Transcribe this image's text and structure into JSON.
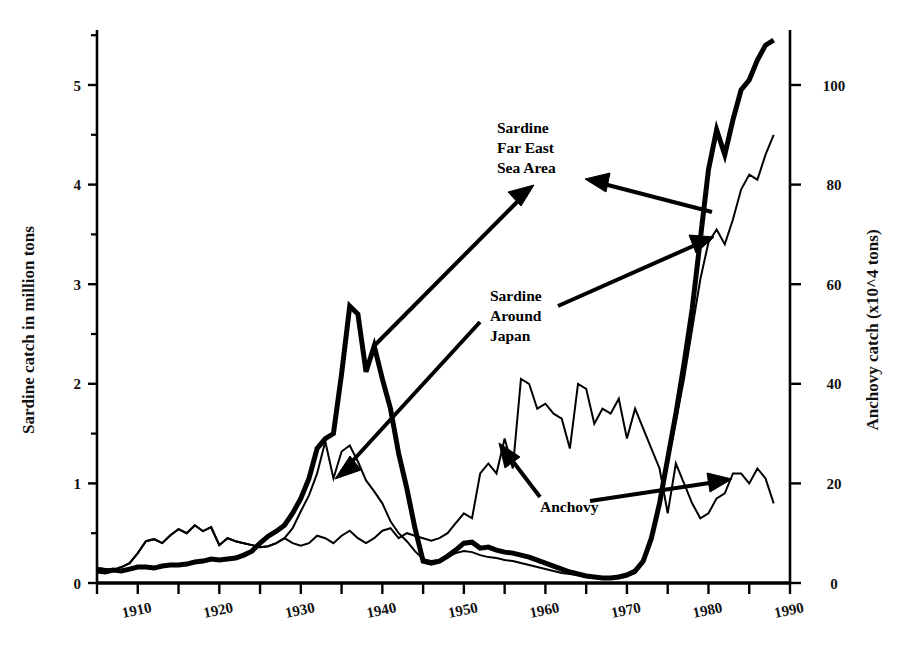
{
  "chart_data": {
    "type": "line",
    "title": "",
    "xlabel": "",
    "ylabel": "Sardine catch in million tons",
    "y2label": "Anchovy catch (x10^4 tons)",
    "xlim": [
      1905,
      1990
    ],
    "ylim": [
      0,
      5.5
    ],
    "y2lim": [
      0,
      110
    ],
    "grid": false,
    "legend_position": "inline-annotations",
    "xticks": [
      1910,
      1920,
      1930,
      1940,
      1950,
      1960,
      1970,
      1980,
      1990
    ],
    "xtick_labels": [
      "1910",
      "1920",
      "1930",
      "1940",
      "1950",
      "1960",
      "1970",
      "1980",
      "1990"
    ],
    "xminor_ticks": [
      1905,
      1915,
      1925,
      1935,
      1945,
      1955,
      1965,
      1975,
      1985
    ],
    "yticks": [
      0,
      1,
      2,
      3,
      4,
      5
    ],
    "ytick_labels": [
      "0",
      "1",
      "2",
      "3",
      "4",
      "5"
    ],
    "yminor_ticks": [
      0.5,
      1.5,
      2.5,
      3.5,
      4.5,
      5.5
    ],
    "y2ticks": [
      0,
      20,
      40,
      60,
      80,
      100
    ],
    "y2tick_labels": [
      "0",
      "20",
      "40",
      "60",
      "80",
      "100"
    ],
    "series": [
      {
        "name": "Sardine Far East Sea Area",
        "axis": "left",
        "style": "thick",
        "linewidth": 5,
        "color": "#000000",
        "x": [
          1905,
          1906,
          1907,
          1908,
          1909,
          1910,
          1911,
          1912,
          1913,
          1914,
          1915,
          1916,
          1917,
          1918,
          1919,
          1920,
          1921,
          1922,
          1923,
          1924,
          1925,
          1926,
          1927,
          1928,
          1929,
          1930,
          1931,
          1932,
          1933,
          1934,
          1935,
          1936,
          1937,
          1938,
          1939,
          1940,
          1941,
          1942,
          1943,
          1944,
          1945,
          1946,
          1947,
          1948,
          1949,
          1950,
          1951,
          1952,
          1953,
          1954,
          1955,
          1956,
          1957,
          1958,
          1959,
          1960,
          1961,
          1962,
          1963,
          1964,
          1965,
          1966,
          1967,
          1968,
          1969,
          1970,
          1971,
          1972,
          1973,
          1974,
          1975,
          1976,
          1977,
          1978,
          1979,
          1980,
          1981,
          1982,
          1983,
          1984,
          1985,
          1986,
          1987,
          1988
        ],
        "y": [
          0.12,
          0.11,
          0.13,
          0.12,
          0.14,
          0.16,
          0.16,
          0.15,
          0.17,
          0.18,
          0.18,
          0.19,
          0.21,
          0.22,
          0.24,
          0.23,
          0.24,
          0.25,
          0.28,
          0.32,
          0.4,
          0.47,
          0.52,
          0.58,
          0.7,
          0.85,
          1.05,
          1.35,
          1.45,
          1.5,
          2.1,
          2.78,
          2.7,
          2.12,
          2.38,
          2.05,
          1.75,
          1.3,
          0.95,
          0.55,
          0.22,
          0.2,
          0.22,
          0.27,
          0.33,
          0.4,
          0.41,
          0.35,
          0.36,
          0.33,
          0.31,
          0.3,
          0.28,
          0.26,
          0.23,
          0.2,
          0.17,
          0.14,
          0.11,
          0.09,
          0.07,
          0.06,
          0.05,
          0.05,
          0.06,
          0.08,
          0.12,
          0.22,
          0.45,
          0.8,
          1.25,
          1.7,
          2.2,
          2.75,
          3.45,
          4.15,
          4.55,
          4.3,
          4.65,
          4.95,
          5.05,
          5.25,
          5.4,
          5.45
        ]
      },
      {
        "name": "Sardine Around Japan",
        "axis": "left",
        "style": "thin",
        "linewidth": 2,
        "color": "#000000",
        "x": [
          1905,
          1906,
          1907,
          1908,
          1909,
          1910,
          1911,
          1912,
          1913,
          1914,
          1915,
          1916,
          1917,
          1918,
          1919,
          1920,
          1921,
          1922,
          1923,
          1924,
          1925,
          1926,
          1927,
          1928,
          1929,
          1930,
          1931,
          1932,
          1933,
          1934,
          1935,
          1936,
          1937,
          1938,
          1939,
          1940,
          1941,
          1942,
          1943,
          1944,
          1945,
          1946,
          1947,
          1948,
          1949,
          1950,
          1951,
          1952,
          1953,
          1954,
          1955,
          1956,
          1957,
          1958,
          1959,
          1960,
          1961,
          1962,
          1963,
          1964,
          1965,
          1966,
          1967,
          1968,
          1969,
          1970,
          1971,
          1972,
          1973,
          1974,
          1975,
          1976,
          1977,
          1978,
          1979,
          1980,
          1981,
          1982,
          1983,
          1984,
          1985,
          1986,
          1987,
          1988
        ],
        "y": [
          0.15,
          0.14,
          0.13,
          0.16,
          0.2,
          0.3,
          0.42,
          0.44,
          0.4,
          0.48,
          0.54,
          0.5,
          0.58,
          0.52,
          0.56,
          0.38,
          0.45,
          0.42,
          0.4,
          0.38,
          0.36,
          0.37,
          0.4,
          0.45,
          0.55,
          0.72,
          0.88,
          1.1,
          1.42,
          1.05,
          1.32,
          1.38,
          1.22,
          1.03,
          0.92,
          0.8,
          0.62,
          0.5,
          0.42,
          0.32,
          0.24,
          0.22,
          0.23,
          0.26,
          0.3,
          0.32,
          0.31,
          0.28,
          0.26,
          0.25,
          0.23,
          0.22,
          0.2,
          0.18,
          0.16,
          0.14,
          0.12,
          0.1,
          0.09,
          0.08,
          0.07,
          0.06,
          0.05,
          0.05,
          0.06,
          0.07,
          0.1,
          0.2,
          0.42,
          0.78,
          1.22,
          1.62,
          2.05,
          2.55,
          3.05,
          3.42,
          3.55,
          3.4,
          3.65,
          3.95,
          4.1,
          4.05,
          4.3,
          4.5
        ]
      },
      {
        "name": "Anchovy",
        "axis": "right",
        "style": "thin",
        "linewidth": 2,
        "color": "#000000",
        "x": [
          1905,
          1906,
          1907,
          1908,
          1909,
          1910,
          1911,
          1912,
          1913,
          1914,
          1915,
          1916,
          1917,
          1918,
          1919,
          1920,
          1921,
          1922,
          1923,
          1924,
          1925,
          1926,
          1927,
          1928,
          1929,
          1930,
          1931,
          1932,
          1933,
          1934,
          1935,
          1936,
          1937,
          1938,
          1939,
          1940,
          1941,
          1942,
          1943,
          1944,
          1945,
          1946,
          1947,
          1948,
          1949,
          1950,
          1951,
          1952,
          1953,
          1954,
          1955,
          1956,
          1957,
          1958,
          1959,
          1960,
          1961,
          1962,
          1963,
          1964,
          1965,
          1966,
          1967,
          1968,
          1969,
          1970,
          1971,
          1972,
          1973,
          1974,
          1975,
          1976,
          1977,
          1978,
          1979,
          1980,
          1981,
          1982,
          1983,
          1984,
          1985,
          1986,
          1987,
          1988
        ],
        "y": [
          3.0,
          2.8,
          2.6,
          3.2,
          4.0,
          6.0,
          8.4,
          8.8,
          8.0,
          9.6,
          10.8,
          10.0,
          11.6,
          10.4,
          11.2,
          7.6,
          9.0,
          8.4,
          8.0,
          7.6,
          7.2,
          7.4,
          8.0,
          9.0,
          8.0,
          7.5,
          8.0,
          9.5,
          9.0,
          8.0,
          9.5,
          10.5,
          9.0,
          8.0,
          9.0,
          10.5,
          11.0,
          9.0,
          10.0,
          9.5,
          9.0,
          8.5,
          9.0,
          10.0,
          12.0,
          14.0,
          13.0,
          22.0,
          24.0,
          22.0,
          29.0,
          23.0,
          41.0,
          40.0,
          35.0,
          36.0,
          34.0,
          33.0,
          27.0,
          40.0,
          39.0,
          32.0,
          35.0,
          34.0,
          37.0,
          29.0,
          35.0,
          31.0,
          27.0,
          23.0,
          14.0,
          24.0,
          20.0,
          16.0,
          13.0,
          14.0,
          17.0,
          18.0,
          22.0,
          22.0,
          20.0,
          23.0,
          21.0,
          16.0
        ]
      }
    ],
    "annotations": [
      {
        "id": "ann-far-east",
        "label": "Sardine\nFar East\nSea Area",
        "lines": [
          "Sardine",
          "Far East",
          "Sea Area"
        ]
      },
      {
        "id": "ann-around-japan",
        "label": "Sardine\nAround\nJapan",
        "lines": [
          "Sardine",
          "Around",
          "Japan"
        ]
      },
      {
        "id": "ann-anchovy",
        "label": "Anchovy",
        "lines": [
          "Anchovy"
        ]
      }
    ]
  },
  "axes": {
    "left_title": "Sardine catch in million tons",
    "right_title": "Anchovy catch (x10^4 tons)"
  },
  "colors": {
    "ink": "#000000",
    "background": "#ffffff"
  }
}
